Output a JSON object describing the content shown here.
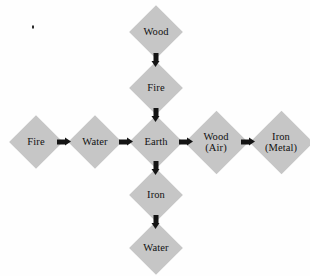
{
  "diagram": {
    "background_color": "#fefefe",
    "node_fill_color": "#c6c6c6",
    "arrow_color": "#141414",
    "text_color": "#111111",
    "nodes": [
      {
        "id": "top",
        "label": "Wood",
        "sub": "",
        "x": 156,
        "y": 32,
        "shape": "diamond"
      },
      {
        "id": "upper",
        "label": "Fire",
        "sub": "",
        "x": 156,
        "y": 88,
        "shape": "diamond"
      },
      {
        "id": "left2",
        "label": "Fire",
        "sub": "",
        "x": 36,
        "y": 142,
        "shape": "diamond"
      },
      {
        "id": "left1",
        "label": "Water",
        "sub": "",
        "x": 95,
        "y": 142,
        "shape": "diamond"
      },
      {
        "id": "center",
        "label": "Earth",
        "sub": "",
        "x": 156,
        "y": 142,
        "shape": "diamond"
      },
      {
        "id": "right1",
        "label": "Wood",
        "sub": "(Air)",
        "x": 216,
        "y": 142,
        "shape": "diamond"
      },
      {
        "id": "right2",
        "label": "Iron",
        "sub": "(Metal)",
        "x": 281,
        "y": 142,
        "shape": "diamond"
      },
      {
        "id": "lower",
        "label": "Iron",
        "sub": "",
        "x": 156,
        "y": 195,
        "shape": "diamond"
      },
      {
        "id": "bottom",
        "label": "Water",
        "sub": "",
        "x": 156,
        "y": 248,
        "shape": "diamond"
      }
    ],
    "arrows": [
      {
        "id": "a1",
        "from": "left2",
        "to": "left1",
        "direction": "right",
        "x": 64,
        "y": 142
      },
      {
        "id": "a2",
        "from": "left1",
        "to": "center",
        "direction": "right",
        "x": 126,
        "y": 142
      },
      {
        "id": "a3",
        "from": "center",
        "to": "right1",
        "direction": "right",
        "x": 186,
        "y": 142
      },
      {
        "id": "a4",
        "from": "right1",
        "to": "right2",
        "direction": "right",
        "x": 248,
        "y": 142
      },
      {
        "id": "a5",
        "from": "top",
        "to": "upper",
        "direction": "down",
        "x": 156,
        "y": 60
      },
      {
        "id": "a6",
        "from": "upper",
        "to": "center",
        "direction": "down",
        "x": 156,
        "y": 115
      },
      {
        "id": "a7",
        "from": "center",
        "to": "lower",
        "direction": "down",
        "x": 156,
        "y": 168
      },
      {
        "id": "a8",
        "from": "lower",
        "to": "bottom",
        "direction": "down",
        "x": 156,
        "y": 222
      }
    ],
    "artifacts": [
      {
        "id": "speck",
        "x": 33,
        "y": 27
      }
    ]
  }
}
